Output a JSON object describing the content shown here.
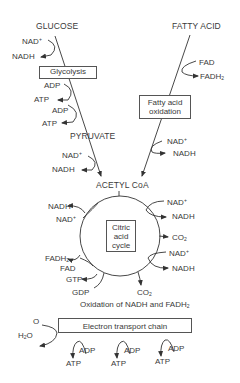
{
  "diagram": {
    "inputs": {
      "glucose": "GLUCOSE",
      "fatty_acid": "FATTY ACID"
    },
    "glycolysis": {
      "box_label": "Glycolysis",
      "cofactors": [
        {
          "in": "NAD+",
          "out": "NADH"
        },
        {
          "in": "ADP",
          "out": "ATP"
        },
        {
          "in": "ADP",
          "out": "ATP"
        }
      ],
      "product": "PYRUVATE",
      "post_cofactor": {
        "in": "NAD+",
        "out": "NADH"
      }
    },
    "fatty_acid_oxidation": {
      "box_line1": "Fatty acid",
      "box_line2": "oxidation",
      "cofactor_top": {
        "in": "FAD",
        "out": "FADH2"
      },
      "cofactor_bottom": {
        "in": "NAD+",
        "out": "NADH"
      }
    },
    "acetyl_coa": "ACETYL CoA",
    "citric_acid_cycle": {
      "box_line1": "Citric",
      "box_line2": "acid",
      "box_line3": "cycle",
      "left": [
        {
          "in": "NAD+",
          "out": "NADH"
        },
        {
          "in": "FAD",
          "out": "FADH2"
        },
        {
          "in": "GDP",
          "out": "GTP"
        }
      ],
      "right": [
        {
          "in": "NAD+",
          "out": "NADH"
        },
        {
          "out": "CO2"
        },
        {
          "in": "NAD+",
          "out": "NADH"
        }
      ],
      "bottom": {
        "out": "CO2"
      }
    },
    "oxidation_caption": "Oxidation of NADH and FADH2",
    "electron_transport": {
      "box_label": "Electron transport chain",
      "oxygen_in": "O",
      "water_out": "H2O",
      "atp_steps": [
        {
          "in": "ADP",
          "out": "ATP"
        },
        {
          "in": "ADP",
          "out": "ATP"
        },
        {
          "in": "ADP",
          "out": "ATP"
        }
      ]
    },
    "colors": {
      "line": "#333333",
      "text": "#3a3a3a",
      "background": "#ffffff"
    }
  }
}
